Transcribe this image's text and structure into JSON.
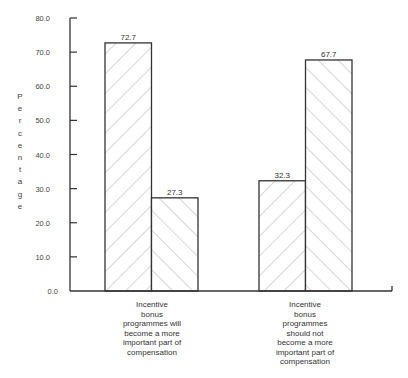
{
  "chart_data": {
    "type": "bar",
    "title": "",
    "xlabel": "",
    "ylabel": "Percentage",
    "ylim": [
      0,
      80
    ],
    "yticks": [
      "0.0",
      "10.0",
      "20.0",
      "30.0",
      "40.0",
      "50.0",
      "60.0",
      "70.0",
      "80.0"
    ],
    "grid": false,
    "legend": "none",
    "categories": [
      [
        "Incentive",
        "bonus",
        "programmes will",
        "become a more",
        "important part of",
        "compensation"
      ],
      [
        "Incentive",
        "bonus",
        "programmes",
        "should not",
        "become a more",
        "important part of",
        "compensation"
      ]
    ],
    "series": [
      {
        "name": "Series A (backslash hatch)",
        "values": [
          72.7,
          32.3
        ],
        "labels": [
          "72.7",
          "32.3"
        ],
        "hatch": "backslash"
      },
      {
        "name": "Series B (forward-slash hatch)",
        "values": [
          27.3,
          67.7
        ],
        "labels": [
          "27.3",
          "67.7"
        ],
        "hatch": "slash"
      }
    ],
    "colors": {
      "axis": "#333333",
      "bar_edge": "#333333",
      "hatch": "#9a9a9a",
      "bar_fill": "#ffffff"
    }
  }
}
